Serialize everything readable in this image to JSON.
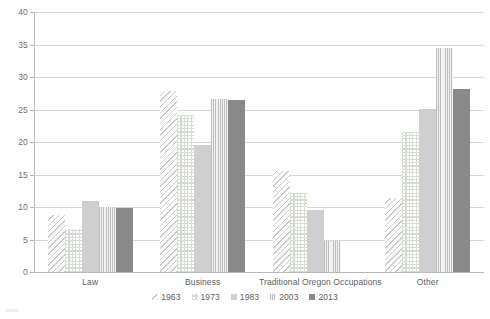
{
  "chart_data": {
    "type": "bar",
    "title": "",
    "subtitle": "",
    "xlabel": "",
    "ylabel": "",
    "grid": true,
    "legend_position": "bottom",
    "ylim": [
      0,
      40
    ],
    "y_ticks": [
      0,
      5,
      10,
      15,
      20,
      25,
      30,
      35,
      40
    ],
    "categories": [
      "Law",
      "Business",
      "Traditional Oregon Occupations",
      "Other"
    ],
    "series": [
      {
        "name": "1963",
        "values": [
          8.8,
          27.8,
          15.5,
          11.4
        ],
        "color": "#c9c9c9",
        "pattern": "diagonal-hatch"
      },
      {
        "name": "1973",
        "values": [
          6.6,
          24.2,
          12.2,
          21.5
        ],
        "color": "#d5ddd0",
        "pattern": "dot-grid"
      },
      {
        "name": "1983",
        "values": [
          10.9,
          19.6,
          9.6,
          25.1
        ],
        "color": "#cfcfcf",
        "pattern": "solid-light"
      },
      {
        "name": "2003",
        "values": [
          10.0,
          26.6,
          4.7,
          34.4
        ],
        "color": "#bdbdbd",
        "pattern": "vertical-stripe"
      },
      {
        "name": "2013",
        "values": [
          9.9,
          26.5,
          0,
          28.1
        ],
        "color": "#898989",
        "pattern": "solid-dark"
      }
    ]
  },
  "axis": {
    "y_tick_labels": [
      "40",
      "35",
      "30",
      "25",
      "20",
      "15",
      "10",
      "5",
      "0"
    ]
  },
  "legend": {
    "items": [
      {
        "label": "1963"
      },
      {
        "label": "1973"
      },
      {
        "label": "1983"
      },
      {
        "label": "2003"
      },
      {
        "label": "2013"
      }
    ]
  }
}
